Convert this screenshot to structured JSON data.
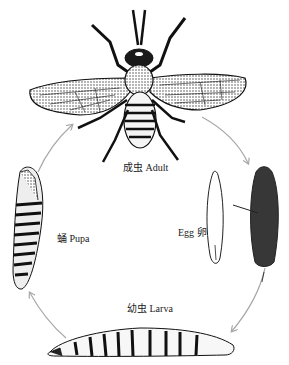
{
  "diagram": {
    "type": "life-cycle",
    "stages": [
      {
        "id": "adult",
        "label": "成虫 Adult"
      },
      {
        "id": "egg",
        "label": "Egg 卵"
      },
      {
        "id": "larva",
        "label": "幼虫 Larva"
      },
      {
        "id": "pupa",
        "label": "蛹 Pupa"
      }
    ],
    "flow": [
      "adult",
      "egg",
      "larva",
      "pupa",
      "adult"
    ],
    "colors": {
      "ink": "#1a1a1a",
      "arrow": "#a8a8a8",
      "background": "#ffffff"
    }
  }
}
